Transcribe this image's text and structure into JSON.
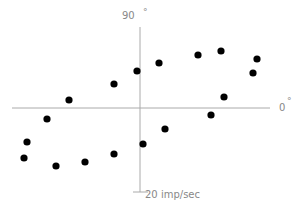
{
  "chart_data": {
    "type": "scatter",
    "title": "",
    "polar_like_axes": true,
    "labels": {
      "top": "90",
      "right": "0",
      "degree_symbol": "°",
      "scale": "20 imp/sec"
    },
    "axis_color": "#aaaaaa",
    "point_color": "#000000",
    "points_px": [
      {
        "x": 24,
        "y": 158
      },
      {
        "x": 27,
        "y": 142
      },
      {
        "x": 47,
        "y": 119
      },
      {
        "x": 56,
        "y": 166
      },
      {
        "x": 69,
        "y": 100
      },
      {
        "x": 85,
        "y": 162
      },
      {
        "x": 114,
        "y": 154
      },
      {
        "x": 114,
        "y": 84
      },
      {
        "x": 137,
        "y": 71
      },
      {
        "x": 143,
        "y": 144
      },
      {
        "x": 159,
        "y": 63
      },
      {
        "x": 165,
        "y": 129
      },
      {
        "x": 198,
        "y": 55
      },
      {
        "x": 211,
        "y": 115
      },
      {
        "x": 221,
        "y": 51
      },
      {
        "x": 224,
        "y": 97
      },
      {
        "x": 253,
        "y": 73
      },
      {
        "x": 257,
        "y": 59
      }
    ],
    "axes_px": {
      "origin": {
        "x": 140,
        "y": 108
      },
      "h_from": 12,
      "h_to": 270,
      "v_from": 27,
      "v_to": 192
    }
  }
}
